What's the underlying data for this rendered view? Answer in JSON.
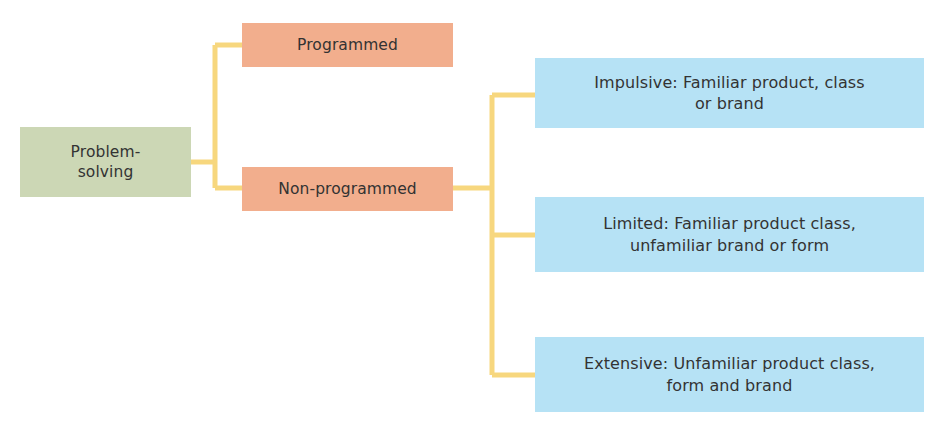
{
  "diagram": {
    "type": "hierarchy-tree",
    "background_color": "#ffffff",
    "connector_color": "#f7d77e",
    "text_color": "#333333",
    "root": {
      "label": "Problem-\nsolving",
      "color": "#ccd7b5"
    },
    "level2": [
      {
        "label": "Programmed",
        "color": "#f2ae8d"
      },
      {
        "label": "Non-programmed",
        "color": "#f2ae8d"
      }
    ],
    "level3": [
      {
        "label": "Impulsive: Familiar product, class\nor brand",
        "color": "#b6e2f5"
      },
      {
        "label": "Limited: Familiar product class,\nunfamiliar brand or form",
        "color": "#b6e2f5"
      },
      {
        "label": "Extensive: Unfamiliar product class,\nform and brand",
        "color": "#b6e2f5"
      }
    ]
  }
}
